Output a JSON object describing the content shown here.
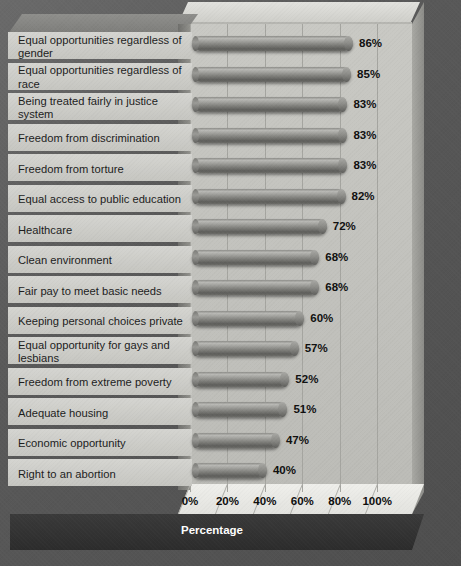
{
  "chart_data": {
    "type": "bar",
    "orientation": "horizontal",
    "title": "",
    "xlabel": "Percentage",
    "ylabel": "",
    "xlim": [
      0,
      110
    ],
    "grid": true,
    "legend": null,
    "xticks": [
      "0%",
      "20%",
      "40%",
      "60%",
      "80%",
      "100%"
    ],
    "xtick_values": [
      0,
      20,
      40,
      60,
      80,
      100
    ],
    "categories": [
      "Equal opportunities regardless of gender",
      "Equal opportunities regardless of race",
      "Being treated fairly in justice system",
      "Freedom from discrimination",
      "Freedom from torture",
      "Equal access to public education",
      "Healthcare",
      "Clean environment",
      "Fair pay to meet basic needs",
      "Keeping personal choices private",
      "Equal opportunity for gays and lesbians",
      "Freedom from extreme poverty",
      "Adequate housing",
      "Economic opportunity",
      "Right to an abortion"
    ],
    "values": [
      86,
      85,
      83,
      83,
      83,
      82,
      72,
      68,
      68,
      60,
      57,
      52,
      51,
      47,
      40
    ],
    "value_labels": [
      "86%",
      "85%",
      "83%",
      "83%",
      "83%",
      "82%",
      "72%",
      "68%",
      "68%",
      "60%",
      "57%",
      "52%",
      "51%",
      "47%",
      "40%"
    ]
  },
  "axis": {
    "x_title": "Percentage"
  },
  "colors": {
    "background": "#575757",
    "plot_wall": "#c5c5c0",
    "bar_light": "#b8b8b4",
    "bar_dark": "#5e5e5b",
    "label_band": "#cfcfca",
    "footer": "#323232",
    "text": "#101010"
  }
}
